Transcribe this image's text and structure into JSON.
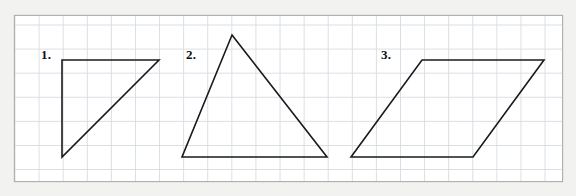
{
  "page": {
    "background_color": "#f2f2f0",
    "paper_color": "#ffffff",
    "width": 576,
    "height": 196
  },
  "grid": {
    "frame": {
      "x": 14,
      "y": 15,
      "width": 549,
      "height": 167
    },
    "cell_size": 24,
    "line_color": "#d9dee4",
    "border_color": "#b0b0b0",
    "columns": 23,
    "rows": 7
  },
  "figures": [
    {
      "label": "1.",
      "label_position": {
        "x": 41,
        "y": 48
      },
      "shape": "right-triangle",
      "stroke_color": "#1a1a1a",
      "stroke_width": 1.6,
      "points": "62,60 159,60 62,157",
      "vertices": [
        {
          "x": 62,
          "y": 60
        },
        {
          "x": 159,
          "y": 60
        },
        {
          "x": 62,
          "y": 157
        }
      ]
    },
    {
      "label": "2.",
      "label_position": {
        "x": 186,
        "y": 48
      },
      "shape": "scalene-triangle",
      "stroke_color": "#1a1a1a",
      "stroke_width": 1.6,
      "points": "232,35 327,157 182,157",
      "vertices": [
        {
          "x": 232,
          "y": 35
        },
        {
          "x": 327,
          "y": 157
        },
        {
          "x": 182,
          "y": 157
        }
      ]
    },
    {
      "label": "3.",
      "label_position": {
        "x": 381,
        "y": 48
      },
      "shape": "parallelogram",
      "stroke_color": "#1a1a1a",
      "stroke_width": 1.6,
      "points": "422,60 544,60 473,157 351,157",
      "vertices": [
        {
          "x": 422,
          "y": 60
        },
        {
          "x": 544,
          "y": 60
        },
        {
          "x": 473,
          "y": 157
        },
        {
          "x": 351,
          "y": 157
        }
      ]
    }
  ]
}
